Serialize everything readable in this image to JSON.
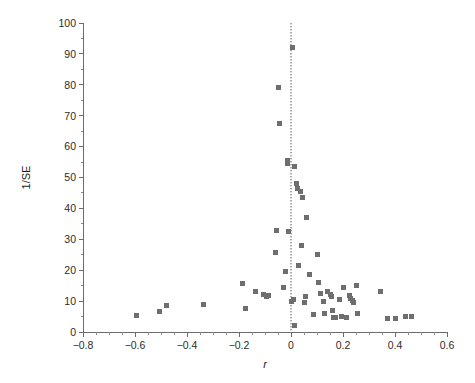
{
  "figure": {
    "name": "funnel-plot",
    "background": "#ffffff",
    "point_color": "#6e6e6e",
    "axis_color": "#6b6b6b"
  },
  "chart_data": {
    "type": "scatter",
    "title": "",
    "subtitle": "",
    "xlabel": "r",
    "ylabel": "1/SE",
    "xlim": [
      -0.8,
      0.6
    ],
    "ylim": [
      0,
      100
    ],
    "xticks": [
      -0.8,
      -0.6,
      -0.4,
      -0.2,
      0,
      0.2,
      0.4,
      0.6
    ],
    "xticklabels": [
      "−0.8",
      "−0.6",
      "−0.4",
      "−0.2",
      "0",
      "0.2",
      "0.4",
      "0.6"
    ],
    "xminor_step": 0.05,
    "yticks": [
      0,
      10,
      20,
      30,
      40,
      50,
      60,
      70,
      80,
      90,
      100
    ],
    "yticklabels": [
      "0",
      "10",
      "20",
      "30",
      "40",
      "50",
      "60",
      "70",
      "80",
      "90",
      "100"
    ],
    "grid": false,
    "legend": null,
    "annotations": [
      {
        "type": "vline",
        "x": 0.0,
        "style": "dotted",
        "label": "null-effect reference line"
      }
    ],
    "marker": {
      "shape": "square",
      "size_px": 5
    },
    "series": [
      {
        "name": "studies",
        "n": 61,
        "points": [
          [
            -0.595,
            5.2
          ],
          [
            -0.505,
            6.5
          ],
          [
            -0.48,
            8.5
          ],
          [
            -0.335,
            9.0
          ],
          [
            -0.185,
            15.8
          ],
          [
            -0.175,
            7.5
          ],
          [
            -0.135,
            13.0
          ],
          [
            -0.105,
            12.0
          ],
          [
            -0.095,
            11.5
          ],
          [
            -0.085,
            11.8
          ],
          [
            -0.06,
            25.8
          ],
          [
            -0.055,
            33.0
          ],
          [
            -0.05,
            79.0
          ],
          [
            -0.045,
            67.5
          ],
          [
            -0.03,
            14.5
          ],
          [
            -0.02,
            19.5
          ],
          [
            -0.015,
            55.5
          ],
          [
            -0.012,
            54.5
          ],
          [
            -0.01,
            32.5
          ],
          [
            0.0,
            9.8
          ],
          [
            0.005,
            92.0
          ],
          [
            0.008,
            10.5
          ],
          [
            0.012,
            2.0
          ],
          [
            0.015,
            53.5
          ],
          [
            0.02,
            48.0
          ],
          [
            0.025,
            46.5
          ],
          [
            0.03,
            21.5
          ],
          [
            0.035,
            45.5
          ],
          [
            0.04,
            28.0
          ],
          [
            0.045,
            43.5
          ],
          [
            0.05,
            9.5
          ],
          [
            0.055,
            11.5
          ],
          [
            0.06,
            37.0
          ],
          [
            0.07,
            18.5
          ],
          [
            0.085,
            5.8
          ],
          [
            0.1,
            25.0
          ],
          [
            0.105,
            16.0
          ],
          [
            0.115,
            12.5
          ],
          [
            0.125,
            10.0
          ],
          [
            0.13,
            6.0
          ],
          [
            0.14,
            13.0
          ],
          [
            0.15,
            12.2
          ],
          [
            0.155,
            11.5
          ],
          [
            0.16,
            7.0
          ],
          [
            0.165,
            4.8
          ],
          [
            0.17,
            4.6
          ],
          [
            0.185,
            10.5
          ],
          [
            0.195,
            5.0
          ],
          [
            0.2,
            14.5
          ],
          [
            0.215,
            4.7
          ],
          [
            0.225,
            11.8
          ],
          [
            0.23,
            11.0
          ],
          [
            0.235,
            10.2
          ],
          [
            0.24,
            9.5
          ],
          [
            0.25,
            15.0
          ],
          [
            0.255,
            6.0
          ],
          [
            0.345,
            13.0
          ],
          [
            0.37,
            4.5
          ],
          [
            0.4,
            4.5
          ],
          [
            0.44,
            5.0
          ],
          [
            0.465,
            5.0
          ]
        ]
      }
    ]
  }
}
